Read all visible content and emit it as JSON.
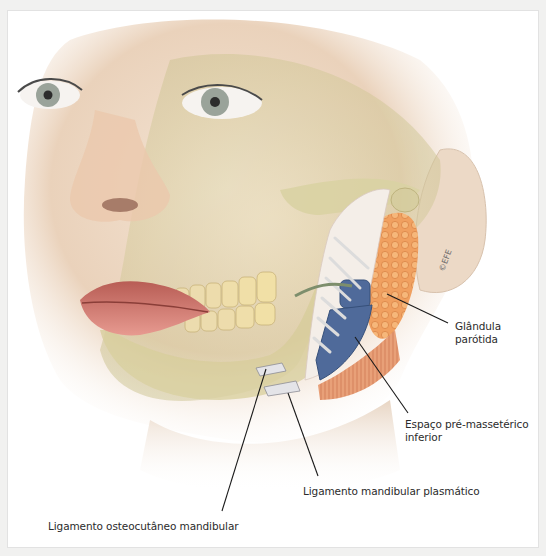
{
  "figure": {
    "copyright_mark": "©EFE",
    "labels": [
      {
        "id": "parotid",
        "lines": [
          "Glândula",
          "parótida"
        ]
      },
      {
        "id": "premasseteric",
        "lines": [
          "Espaço pré-massetérico",
          "inferior"
        ]
      },
      {
        "id": "plasmatic",
        "lines": [
          "Ligamento mandibular plasmático"
        ]
      },
      {
        "id": "osteocutaneous",
        "lines": [
          "Ligamento osteocutâneo mandibular"
        ]
      }
    ]
  },
  "colors": {
    "skin": "#e9cdb3",
    "bone": "#d9d3a6",
    "parotid": "#f0a060",
    "masseter_space": "#4f6a9a",
    "muscle": "#c96a3c",
    "leader_line": "#1a1a1a",
    "text": "#2b2b2b"
  }
}
